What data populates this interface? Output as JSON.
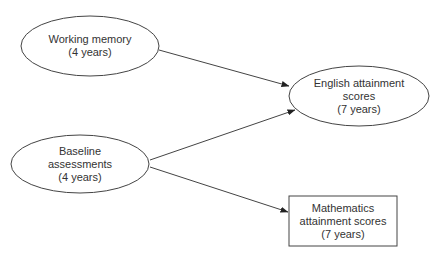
{
  "diagram": {
    "colors": {
      "stroke": "#444444",
      "text": "#333333",
      "background": "#ffffff"
    },
    "nodes": [
      {
        "id": "working-memory",
        "shape": "ellipse",
        "lines": [
          "Working memory",
          "(4 years)"
        ]
      },
      {
        "id": "baseline-assessments",
        "shape": "ellipse",
        "lines": [
          "Baseline",
          "assessments",
          "(4 years)"
        ]
      },
      {
        "id": "english-attainment",
        "shape": "ellipse",
        "lines": [
          "English attainment",
          "scores",
          "(7 years)"
        ]
      },
      {
        "id": "mathematics-attainment",
        "shape": "rectangle",
        "lines": [
          "Mathematics",
          "attainment scores",
          "(7 years)"
        ]
      }
    ],
    "edges": [
      {
        "from": "working-memory",
        "to": "english-attainment",
        "directed": true
      },
      {
        "from": "baseline-assessments",
        "to": "english-attainment",
        "directed": true
      },
      {
        "from": "baseline-assessments",
        "to": "mathematics-attainment",
        "directed": true
      }
    ]
  }
}
